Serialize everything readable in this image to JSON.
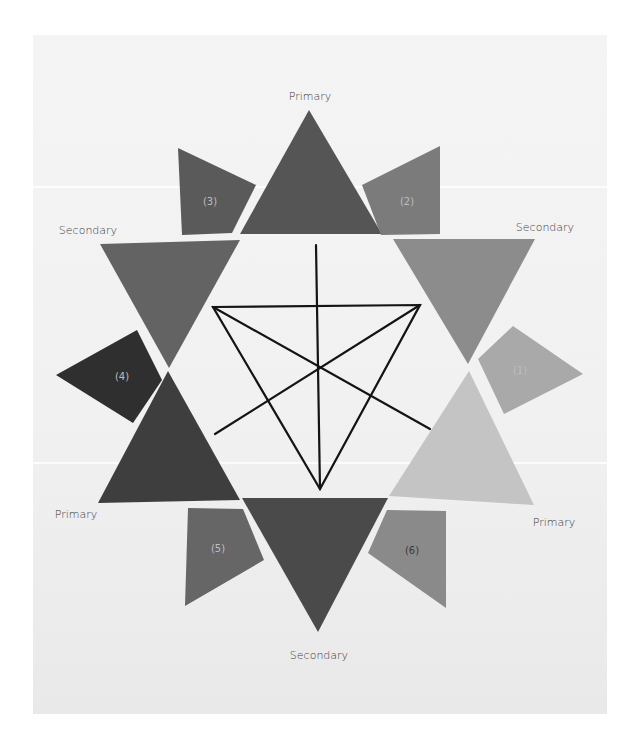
{
  "image": {
    "description": "Paper color-wheel star: six triangles (3 primary, 3 secondary) around a hand-drawn triangle diagram, with six numbered tertiary quadrilaterals",
    "palette": {
      "paper": "#f2f2f2",
      "primary_top": "#555555",
      "primary_bottom_left": "#3e3e3e",
      "primary_bottom_right": "#c4c4c4",
      "secondary_top_left": "#636363",
      "secondary_top_right": "#8c8c8c",
      "secondary_bottom": "#4a4a4a",
      "tertiary_1": "#a9a9a9",
      "tertiary_2": "#7b7b7b",
      "tertiary_3": "#5a5a5a",
      "tertiary_4": "#2f2f2f",
      "tertiary_5": "#666666",
      "tertiary_6": "#8a8a8a",
      "ink": "#141414"
    }
  },
  "labels": {
    "primary_top": "Primary",
    "primary_bottom_left": "Primary",
    "primary_bottom_right": "Primary",
    "secondary_top_left": "Secondary",
    "secondary_top_right": "Secondary",
    "secondary_bottom": "Secondary"
  },
  "tertiary_numbers": [
    "(1)",
    "(2)",
    "(3)",
    "(4)",
    "(5)",
    "(6)"
  ]
}
